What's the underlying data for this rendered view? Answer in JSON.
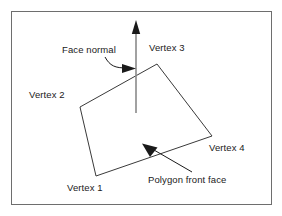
{
  "figure": {
    "frame": {
      "x": 11,
      "y": 11,
      "width": 261,
      "height": 194,
      "stroke": "#6e6e6e",
      "stroke_width": 1
    },
    "background": "#ffffff",
    "line_color": "#3a3a3a",
    "normal_color": "#8a8a8a",
    "text_color": "#1a1a1a"
  },
  "labels": {
    "face_normal": "Face normal",
    "vertex_1": "Vertex 1",
    "vertex_2": "Vertex 2",
    "vertex_3": "Vertex 3",
    "vertex_4": "Vertex 4",
    "polygon_front_face": "Polygon front face"
  },
  "geometry": {
    "polygon": {
      "name": "quad-polygon",
      "points": "96,176 80,107 157,64 212,136",
      "vertices": [
        {
          "label": "Vertex 1",
          "x": 96,
          "y": 176
        },
        {
          "label": "Vertex 2",
          "x": 80,
          "y": 107
        },
        {
          "label": "Vertex 3",
          "x": 157,
          "y": 64
        },
        {
          "label": "Vertex 4",
          "x": 212,
          "y": 136
        }
      ]
    },
    "normal_arrow": {
      "name": "face-normal-arrow",
      "x1": 136,
      "y1": 113,
      "x2": 136,
      "y2": 30,
      "head": "136,21 132.2,33 139.8,33"
    },
    "face_normal_leader": {
      "name": "face-normal-leader",
      "path": "M 105 57 C 110 66, 115 68, 127 68",
      "head": "136,68 124,63.6 124,72.4"
    },
    "front_face_leader": {
      "name": "polygon-front-face-leader",
      "x1": 192,
      "y1": 172,
      "x2": 152,
      "y2": 149,
      "head": "143,144 157,146 150,156"
    }
  }
}
